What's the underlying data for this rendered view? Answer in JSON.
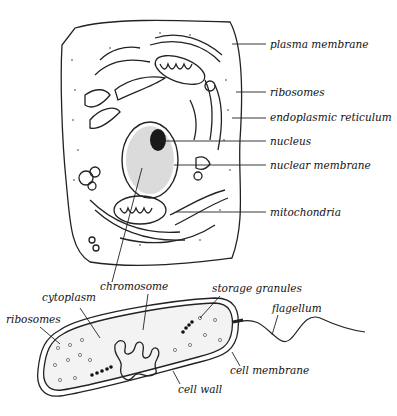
{
  "diagram": {
    "type": "cell-comparison",
    "eukaryotic_cell": {
      "labels": [
        {
          "id": "plasma-membrane",
          "text": "plasma membrane"
        },
        {
          "id": "ribosomes",
          "text": "ribosomes"
        },
        {
          "id": "endoplasmic-reticulum",
          "text": "endoplasmic reticulum"
        },
        {
          "id": "nucleus",
          "text": "nucleus"
        },
        {
          "id": "nuclear-membrane",
          "text": "nuclear membrane"
        },
        {
          "id": "mitochondria",
          "text": "mitochondria"
        },
        {
          "id": "chromosome",
          "text": "chromosome"
        }
      ]
    },
    "prokaryotic_cell": {
      "labels": [
        {
          "id": "cytoplasm",
          "text": "cytoplasm"
        },
        {
          "id": "ribosomes",
          "text": "ribosomes"
        },
        {
          "id": "storage-granules",
          "text": "storage granules"
        },
        {
          "id": "flagellum",
          "text": "flagellum"
        },
        {
          "id": "cell-membrane",
          "text": "cell membrane"
        },
        {
          "id": "cell-wall",
          "text": "cell wall"
        }
      ]
    },
    "colors": {
      "line": "#222222",
      "background": "#ffffff",
      "nucleolus": "#1a1a1a"
    }
  }
}
